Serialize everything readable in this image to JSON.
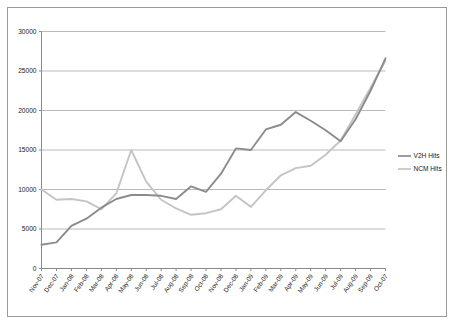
{
  "chart_data": {
    "type": "line",
    "title": "",
    "subtitle": "",
    "xlabel": "",
    "ylabel": "",
    "grid": true,
    "legend_position": "right",
    "ylim": [
      0,
      30000
    ],
    "ytick_labels": [
      "30000",
      "25000",
      "20000",
      "15000",
      "10000",
      "5000",
      "0"
    ],
    "ytick_values": [
      30000,
      25000,
      20000,
      15000,
      10000,
      5000,
      0
    ],
    "categories": [
      "Nov-07",
      "Dec-07",
      "Jan-08",
      "Feb-08",
      "Mar-08",
      "Apr-08",
      "May-08",
      "Jun-08",
      "Jul-08",
      "Aug-08",
      "Sep-08",
      "Oct-08",
      "Nov-08",
      "Dec-08",
      "Jan-09",
      "Feb-09",
      "Mar-09",
      "Apr-09",
      "May-09",
      "Jun-09",
      "Jul-09",
      "Aug-09",
      "Sep-09",
      "Oct-07"
    ],
    "series": [
      {
        "name": "V2H Hits",
        "color": "#8c8c8c",
        "values": [
          3000,
          3300,
          5400,
          6300,
          7700,
          8800,
          9300,
          9300,
          9200,
          8800,
          10400,
          9700,
          12000,
          15200,
          15000,
          17600,
          18200,
          19800,
          18700,
          17500,
          16100,
          18900,
          22500,
          26600
        ]
      },
      {
        "name": "NCM Hits",
        "color": "#c4c4c4",
        "values": [
          10000,
          8700,
          8800,
          8500,
          7500,
          9500,
          15000,
          11000,
          8700,
          7600,
          6800,
          7000,
          7500,
          9200,
          7800,
          9900,
          11800,
          12700,
          13000,
          14400,
          16200,
          19500,
          22900,
          26300
        ]
      }
    ]
  },
  "legend": {
    "entries": [
      {
        "label": "V2H Hits",
        "color": "#8c8c8c"
      },
      {
        "label": "NCM Hits",
        "color": "#c4c4c4"
      }
    ]
  },
  "colors": {
    "v2h": "#8c8c8c",
    "ncm": "#c4c4c4",
    "gridline": "#a8a8a8",
    "axis": "#8a8a8a",
    "frame": "#9a9a9a",
    "background": "#ffffff",
    "text": "#1a1a1a"
  }
}
